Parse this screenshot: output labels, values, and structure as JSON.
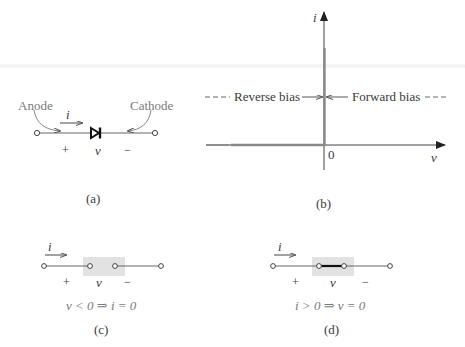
{
  "figure": {
    "panel_a": {
      "caption": "(a)",
      "anode_label": "Anode",
      "cathode_label": "Cathode",
      "current_label": "i",
      "plus_label": "+",
      "voltage_label": "v",
      "minus_label": "−"
    },
    "panel_b": {
      "caption": "(b)",
      "y_axis_label": "i",
      "x_axis_label": "v",
      "origin_label": "0",
      "reverse_bias_label": "Reverse bias",
      "forward_bias_label": "Forward bias"
    },
    "panel_c": {
      "caption": "(c)",
      "current_label": "i",
      "plus_label": "+",
      "voltage_label": "v",
      "minus_label": "−",
      "condition": "v < 0 ⇒ i = 0"
    },
    "panel_d": {
      "caption": "(d)",
      "current_label": "i",
      "plus_label": "+",
      "voltage_label": "v",
      "minus_label": "−",
      "condition": "i > 0 ⇒ v = 0"
    }
  },
  "colors": {
    "ink": "#3a3a3a",
    "curve": "#8a8a8a",
    "highlight_box": "#e2e2e2"
  }
}
